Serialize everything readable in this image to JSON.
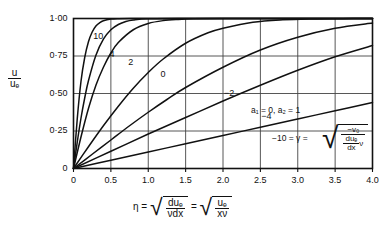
{
  "chart_data": {
    "type": "line",
    "title": "",
    "xlabel": "eta = sqrt(du_e/(nu dx)) = sqrt(u_e/(x nu))",
    "ylabel": "u/u_e",
    "xlim": [
      0,
      4.0
    ],
    "ylim": [
      0,
      1.0
    ],
    "grid": true,
    "legend_position": "inline-curve-labels",
    "xticks": [
      "0",
      "0.5",
      "1.0",
      "1.5",
      "2.0",
      "2.5",
      "3.0",
      "3.5",
      "4.0"
    ],
    "xtick_values": [
      0,
      0.5,
      1.0,
      1.5,
      2.0,
      2.5,
      3.0,
      3.5,
      4.0
    ],
    "yticks": [
      "0",
      "0·25",
      "0·50",
      "0·75",
      "1·00"
    ],
    "ytick_values": [
      0,
      0.25,
      0.5,
      0.75,
      1.0
    ],
    "series": [
      {
        "name": "10",
        "gamma": 10,
        "x": [
          0,
          0.05,
          0.1,
          0.15,
          0.2,
          0.25,
          0.3,
          0.35,
          0.4,
          0.5,
          0.6,
          0.8,
          1.0,
          2.0,
          3.0,
          4.0
        ],
        "values": [
          0,
          0.33,
          0.58,
          0.74,
          0.845,
          0.91,
          0.95,
          0.972,
          0.985,
          0.996,
          0.999,
          1.0,
          1.0,
          1.0,
          1.0,
          1.0
        ]
      },
      {
        "name": "4",
        "gamma": 4,
        "x": [
          0,
          0.05,
          0.1,
          0.15,
          0.2,
          0.3,
          0.4,
          0.5,
          0.6,
          0.7,
          0.8,
          1.0,
          1.5,
          2.0,
          3.0,
          4.0
        ],
        "values": [
          0,
          0.175,
          0.335,
          0.47,
          0.585,
          0.755,
          0.862,
          0.925,
          0.96,
          0.98,
          0.99,
          0.998,
          1.0,
          1.0,
          1.0,
          1.0
        ]
      },
      {
        "name": "2",
        "gamma": 2,
        "x": [
          0,
          0.1,
          0.2,
          0.3,
          0.4,
          0.5,
          0.6,
          0.8,
          1.0,
          1.2,
          1.4,
          1.6,
          2.0,
          2.5,
          3.0,
          4.0
        ],
        "values": [
          0,
          0.21,
          0.4,
          0.555,
          0.675,
          0.77,
          0.84,
          0.925,
          0.967,
          0.986,
          0.994,
          0.998,
          1.0,
          1.0,
          1.0,
          1.0
        ]
      },
      {
        "name": "0",
        "gamma": 0,
        "x": [
          0,
          0.2,
          0.4,
          0.6,
          0.8,
          1.0,
          1.2,
          1.5,
          1.8,
          2.0,
          2.4,
          2.8,
          3.2,
          3.6,
          4.0
        ],
        "values": [
          0,
          0.145,
          0.285,
          0.415,
          0.535,
          0.64,
          0.73,
          0.835,
          0.905,
          0.935,
          0.975,
          0.991,
          0.997,
          0.999,
          1.0
        ]
      },
      {
        "name": "-2",
        "gamma": -2,
        "x": [
          0,
          0.25,
          0.5,
          0.75,
          1.0,
          1.25,
          1.5,
          2.0,
          2.5,
          3.0,
          3.5,
          4.0
        ],
        "values": [
          0,
          0.095,
          0.19,
          0.285,
          0.375,
          0.46,
          0.54,
          0.675,
          0.79,
          0.875,
          0.935,
          0.97
        ]
      },
      {
        "name": "-4",
        "gamma": -4,
        "x": [
          0,
          0.5,
          1.0,
          1.5,
          2.0,
          2.5,
          3.0,
          3.5,
          4.0
        ],
        "values": [
          0,
          0.115,
          0.23,
          0.34,
          0.45,
          0.555,
          0.655,
          0.745,
          0.82
        ]
      },
      {
        "name": "-10",
        "gamma": -10,
        "x": [
          0,
          0.5,
          1.0,
          1.5,
          2.0,
          2.5,
          3.0,
          3.5,
          4.0
        ],
        "values": [
          0,
          0.055,
          0.11,
          0.165,
          0.22,
          0.275,
          0.33,
          0.385,
          0.44
        ]
      }
    ],
    "curve_labels": [
      {
        "text": "10",
        "x": 0.33,
        "y": 0.875
      },
      {
        "text": "4",
        "x": 0.55,
        "y": 0.755
      },
      {
        "text": "2",
        "x": 0.8,
        "y": 0.705
      },
      {
        "text": "0",
        "x": 1.23,
        "y": 0.625
      },
      {
        "text": "−2",
        "x": 2.08,
        "y": 0.5
      },
      {
        "text": "−4",
        "x": 2.58,
        "y": 0.345
      }
    ],
    "annotations": {
      "a_params": "a₁ = 0, a₂ = 1",
      "gamma_eq": "−10 = γ =",
      "radical_numerator": "−v₀",
      "radical_den_num": "duₑ",
      "radical_den_den": "dx",
      "radical_den_suffix": "ν"
    },
    "axis_titles": {
      "y": {
        "num": "u",
        "den": "uₑ"
      },
      "x": {
        "eta": "η",
        "eq1": "=",
        "r1_num": "duₑ",
        "r1_den": "νdx",
        "eq2": "=",
        "r2_num": "uₑ",
        "r2_den": "xν"
      }
    },
    "colors": {
      "curve": "#111111",
      "grid": "#444444",
      "frame": "#111111",
      "background": "#ffffff"
    }
  }
}
